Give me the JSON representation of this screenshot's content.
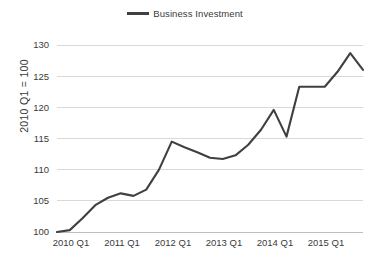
{
  "chart_data": {
    "type": "line",
    "title": "",
    "xlabel": "",
    "ylabel": "2010 Q1 = 100",
    "legend_position": "top-center",
    "grid": true,
    "ylim": [
      100,
      130
    ],
    "yticks": [
      100,
      105,
      110,
      115,
      120,
      125,
      130
    ],
    "xtick_labels": [
      "2010 Q1",
      "2011 Q1",
      "2012 Q1",
      "2013 Q1",
      "2014 Q1",
      "2015 Q1"
    ],
    "x": [
      "2010 Q1",
      "2010 Q2",
      "2010 Q3",
      "2010 Q4",
      "2011 Q1",
      "2011 Q2",
      "2011 Q3",
      "2011 Q4",
      "2012 Q1",
      "2012 Q2",
      "2012 Q3",
      "2012 Q4",
      "2013 Q1",
      "2013 Q2",
      "2013 Q3",
      "2013 Q4",
      "2014 Q1",
      "2014 Q2",
      "2014 Q3",
      "2014 Q4",
      "2015 Q1",
      "2015 Q2",
      "2015 Q3",
      "2015 Q4"
    ],
    "series": [
      {
        "name": "Business Investment",
        "color": "#404040",
        "values": [
          100.0,
          100.3,
          102.2,
          104.3,
          105.5,
          106.2,
          105.8,
          106.8,
          110.0,
          114.5,
          113.6,
          112.8,
          111.9,
          111.7,
          112.3,
          114.0,
          116.4,
          119.6,
          115.3,
          123.3,
          123.3,
          123.3,
          125.7,
          128.7
        ]
      }
    ],
    "series_tail": [
      126.0
    ],
    "annotations": []
  },
  "legend": {
    "entries": [
      {
        "label": "Business Investment",
        "color": "#404040"
      }
    ]
  },
  "axes": {
    "y_title": "2010 Q1 = 100"
  }
}
